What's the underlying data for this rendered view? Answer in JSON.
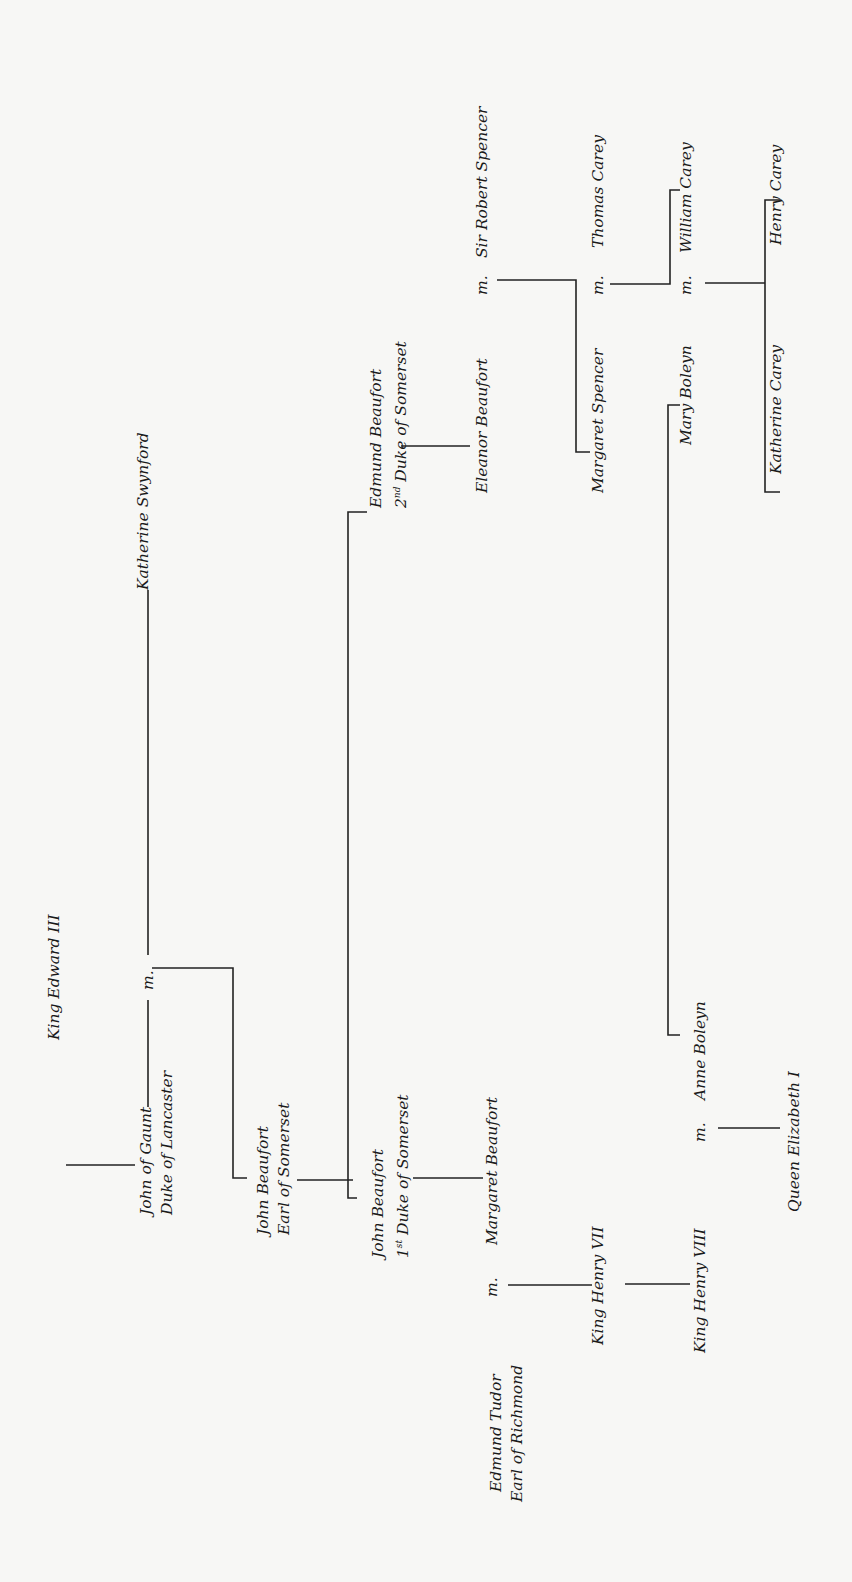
{
  "diagram": {
    "type": "family-tree",
    "orientation": "rotated -90deg",
    "marriage_marker": "m.",
    "people": {
      "edward3": {
        "line1": "King Edward III"
      },
      "gaunt": {
        "line1": "John of Gaunt",
        "line2": "Duke of Lancaster"
      },
      "swynford": {
        "line1": "Katherine Swynford"
      },
      "jb_earl": {
        "line1": "John Beaufort",
        "line2": "Earl of Somerset"
      },
      "jb_duke": {
        "line1": "John Beaufort",
        "line2_ord": "1",
        "line2_sup": "st",
        "line2_rest": " Duke of Somerset"
      },
      "edmund_b": {
        "line1": "Edmund Beaufort",
        "line2_ord": "2",
        "line2_sup": "nd",
        "line2_rest": " Duke of Somerset"
      },
      "eleanor_b": {
        "line1": "Eleanor Beaufort"
      },
      "robert_spencer": {
        "line1": "Sir Robert Spencer"
      },
      "margaret_spencer": {
        "line1": "Margaret Spencer"
      },
      "thomas_carey": {
        "line1": "Thomas Carey"
      },
      "mary_boleyn": {
        "line1": "Mary Boleyn"
      },
      "william_carey": {
        "line1": "William Carey"
      },
      "katherine_carey": {
        "line1": "Katherine Carey"
      },
      "henry_carey": {
        "line1": "Henry Carey"
      },
      "margaret_beaufort": {
        "line1": "Margaret Beaufort"
      },
      "edmund_tudor": {
        "line1": "Edmund Tudor",
        "line2": "Earl of Richmond"
      },
      "henry7": {
        "line1": "King Henry VII"
      },
      "henry8": {
        "line1": "King Henry VIII"
      },
      "anne_boleyn": {
        "line1": "Anne Boleyn"
      },
      "elizabeth1": {
        "line1": "Queen Elizabeth I"
      }
    },
    "marriages": [
      {
        "a": "John of Gaunt",
        "b": "Katherine Swynford",
        "children": [
          "John Beaufort, Earl of Somerset"
        ]
      },
      {
        "a": "Eleanor Beaufort",
        "b": "Sir Robert Spencer",
        "children": [
          "Margaret Spencer"
        ]
      },
      {
        "a": "Margaret Spencer",
        "b": "Thomas Carey",
        "children": [
          "William Carey"
        ]
      },
      {
        "a": "Mary Boleyn",
        "b": "William Carey",
        "children": [
          "Katherine Carey",
          "Henry Carey"
        ]
      },
      {
        "a": "Edmund Tudor",
        "b": "Margaret Beaufort",
        "children": [
          "King Henry VII"
        ]
      },
      {
        "a": "King Henry VIII",
        "b": "Anne Boleyn",
        "children": [
          "Queen Elizabeth I"
        ]
      }
    ]
  }
}
